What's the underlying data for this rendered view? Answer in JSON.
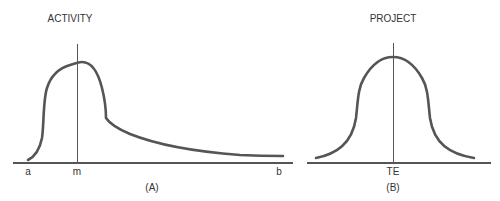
{
  "panels": [
    {
      "id": "A",
      "title": "ACTIVITY",
      "caption": "(A)",
      "axis_labels": {
        "start": "a",
        "mode": "m",
        "end": "b"
      },
      "curve": "right-skewed distribution (beta-like)"
    },
    {
      "id": "B",
      "title": "PROJECT",
      "caption": "(B)",
      "axis_labels": {
        "center": "TE"
      },
      "curve": "symmetric bell-shaped (normal) distribution"
    }
  ],
  "colors": {
    "curve": "#555555",
    "axis": "#555555",
    "text": "#333333",
    "background": "#ffffff"
  }
}
